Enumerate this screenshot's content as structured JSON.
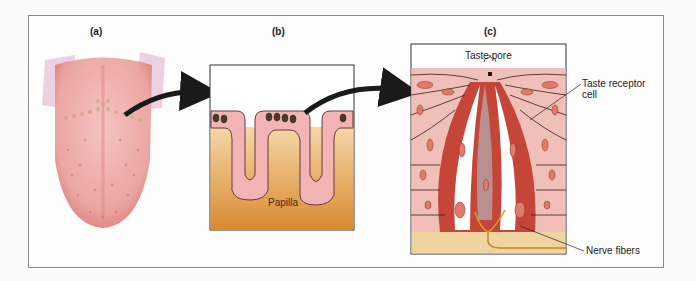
{
  "figure": {
    "panels": [
      {
        "id": "a",
        "label": "(a)",
        "subject": "tongue"
      },
      {
        "id": "b",
        "label": "(b)",
        "subject": "papillae cross-section"
      },
      {
        "id": "c",
        "label": "(c)",
        "subject": "taste bud"
      }
    ],
    "labels": {
      "papilla": "Papilla",
      "taste_pore": "Taste pore",
      "taste_receptor_cell": "Taste receptor\ncell",
      "taste_receptor_line1": "Taste receptor",
      "taste_receptor_line2": "cell",
      "nerve_fibers": "Nerve fibers"
    },
    "colors": {
      "tongue": "#e8a0a0",
      "tongue_edge": "#d06a6a",
      "papilla_pink": "#f2b8b8",
      "tissue_tan": "#e8b070",
      "tissue_dark": "#d89040",
      "bud_red": "#c0392b",
      "cell_pink": "#f0c0b8",
      "nerve": "#d4a020",
      "base_tan": "#f0d4a0",
      "arrow": "#1a1a1a"
    }
  }
}
